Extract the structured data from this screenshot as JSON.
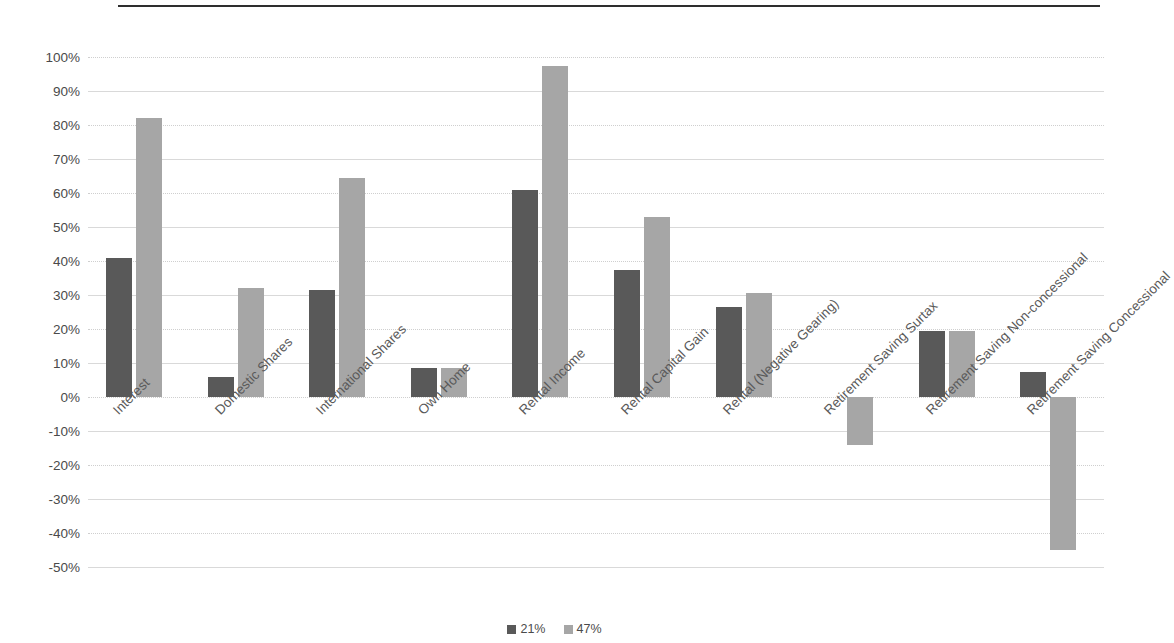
{
  "chart_data": {
    "type": "bar",
    "title": "",
    "subtitle": "",
    "xlabel": "",
    "ylabel": "",
    "ylim": [
      -50,
      100
    ],
    "ytick_step": 10,
    "ytick_labels": [
      "100%",
      "90%",
      "80%",
      "70%",
      "60%",
      "50%",
      "40%",
      "30%",
      "20%",
      "10%",
      "0%",
      "-10%",
      "-20%",
      "-30%",
      "-40%",
      "-50%"
    ],
    "ytick_values": [
      100,
      90,
      80,
      70,
      60,
      50,
      40,
      30,
      20,
      10,
      0,
      -10,
      -20,
      -30,
      -40,
      -50
    ],
    "grid": true,
    "legend_position": "bottom",
    "categories": [
      "Interest",
      "Domestic Shares",
      "International Shares",
      "Own Home",
      "Rental Income",
      "Rental Capital Gain",
      "Rental (Negative Gearing)",
      "Retirement Saving Surtax",
      "Retirement Saving Non-concessional",
      "Retirement Saving Concessional"
    ],
    "series": [
      {
        "name": "21%",
        "color": "#595959",
        "values": [
          41,
          6,
          31.5,
          8.5,
          61,
          37.5,
          26.5,
          0,
          19.5,
          7.5
        ]
      },
      {
        "name": "47%",
        "color": "#a6a6a6",
        "values": [
          82,
          32,
          64.5,
          8.5,
          97.5,
          53,
          30.5,
          -14,
          19.5,
          -45
        ]
      }
    ]
  },
  "legend": {
    "items": [
      {
        "label": "21%",
        "color": "#595959"
      },
      {
        "label": "47%",
        "color": "#a6a6a6"
      }
    ]
  }
}
